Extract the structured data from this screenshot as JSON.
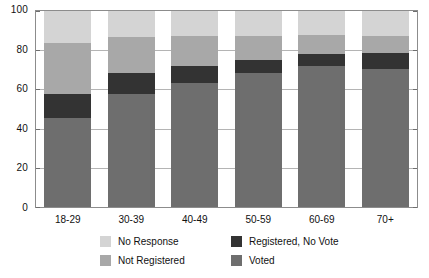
{
  "chart_data": {
    "type": "bar",
    "subtype": "stacked-bar-100",
    "title": "",
    "subtitle": "",
    "xlabel": "",
    "ylabel": "",
    "categories": [
      "18-29",
      "30-39",
      "40-49",
      "50-59",
      "60-69",
      "70+"
    ],
    "series": [
      {
        "name": "Voted",
        "values": [
          45.5,
          57.5,
          63.5,
          68.5,
          72.0,
          70.5
        ],
        "color": "#6e6e6e"
      },
      {
        "name": "Registered, No Vote",
        "values": [
          12.0,
          11.0,
          8.5,
          6.5,
          6.0,
          8.0
        ],
        "color": "#333333"
      },
      {
        "name": "Not Registered",
        "values": [
          26.0,
          18.0,
          15.0,
          12.0,
          10.0,
          8.5
        ],
        "color": "#a8a8a8"
      },
      {
        "name": "No Response",
        "values": [
          16.5,
          13.5,
          13.0,
          13.0,
          12.0,
          13.0
        ],
        "color": "#d4d4d4"
      }
    ],
    "stack_order_bottom_to_top": [
      "Voted",
      "Registered, No Vote",
      "Not Registered",
      "No Response"
    ],
    "ylim": [
      0,
      100
    ],
    "yticks": [
      0,
      20,
      40,
      60,
      80,
      100
    ],
    "ytick_labels": [
      "0",
      "20",
      "40",
      "60",
      "80",
      "100"
    ],
    "grid": true,
    "legend_position": "bottom"
  },
  "axes": {
    "y_tick_labels": [
      "100",
      "80",
      "60",
      "40",
      "20",
      "0"
    ],
    "x_tick_labels": [
      "18-29",
      "30-39",
      "40-49",
      "50-59",
      "60-69",
      "70+"
    ]
  },
  "legend": {
    "items": [
      {
        "label": "No Response",
        "color": "#d4d4d4"
      },
      {
        "label": "Registered, No Vote",
        "color": "#333333"
      },
      {
        "label": "Not Registered",
        "color": "#a8a8a8"
      },
      {
        "label": "Voted",
        "color": "#6e6e6e"
      }
    ]
  },
  "colors": {
    "no_response": "#d4d4d4",
    "not_registered": "#a8a8a8",
    "registered_no_vote": "#333333",
    "voted": "#6e6e6e",
    "axis": "#8c8c8c",
    "grid": "#b4b4b4",
    "text": "#111111",
    "background": "#ffffff"
  }
}
